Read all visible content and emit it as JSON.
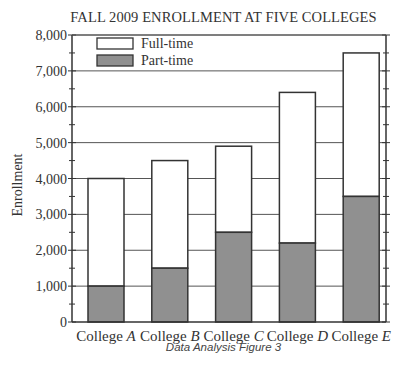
{
  "chart_data": {
    "type": "bar",
    "stacked": true,
    "title": "FALL 2009 ENROLLMENT AT FIVE COLLEGES",
    "xlabel": "",
    "ylabel": "Enrollment",
    "ylim": [
      0,
      8000
    ],
    "yticks": [
      "0",
      "1,000",
      "2,000",
      "3,000",
      "4,000",
      "5,000",
      "6,000",
      "7,000",
      "8,000"
    ],
    "grid": true,
    "legend_position": "upper-left",
    "categories": [
      "College A",
      "College B",
      "College C",
      "College D",
      "College E"
    ],
    "category_labels": [
      {
        "prefix": "College ",
        "letter": "A"
      },
      {
        "prefix": "College ",
        "letter": "B"
      },
      {
        "prefix": "College ",
        "letter": "C"
      },
      {
        "prefix": "College ",
        "letter": "D"
      },
      {
        "prefix": "College ",
        "letter": "E"
      }
    ],
    "series": [
      {
        "name": "Part-time",
        "color": "#909090",
        "values": [
          1000,
          1500,
          2500,
          2200,
          3500
        ]
      },
      {
        "name": "Full-time",
        "color": "#ffffff",
        "values": [
          3000,
          3000,
          2400,
          4200,
          4000
        ]
      }
    ],
    "totals": [
      4000,
      4500,
      4900,
      6400,
      7500
    ]
  },
  "legend": {
    "full_time": "Full-time",
    "part_time": "Part-time"
  },
  "caption": "Data Analysis Figure 3"
}
